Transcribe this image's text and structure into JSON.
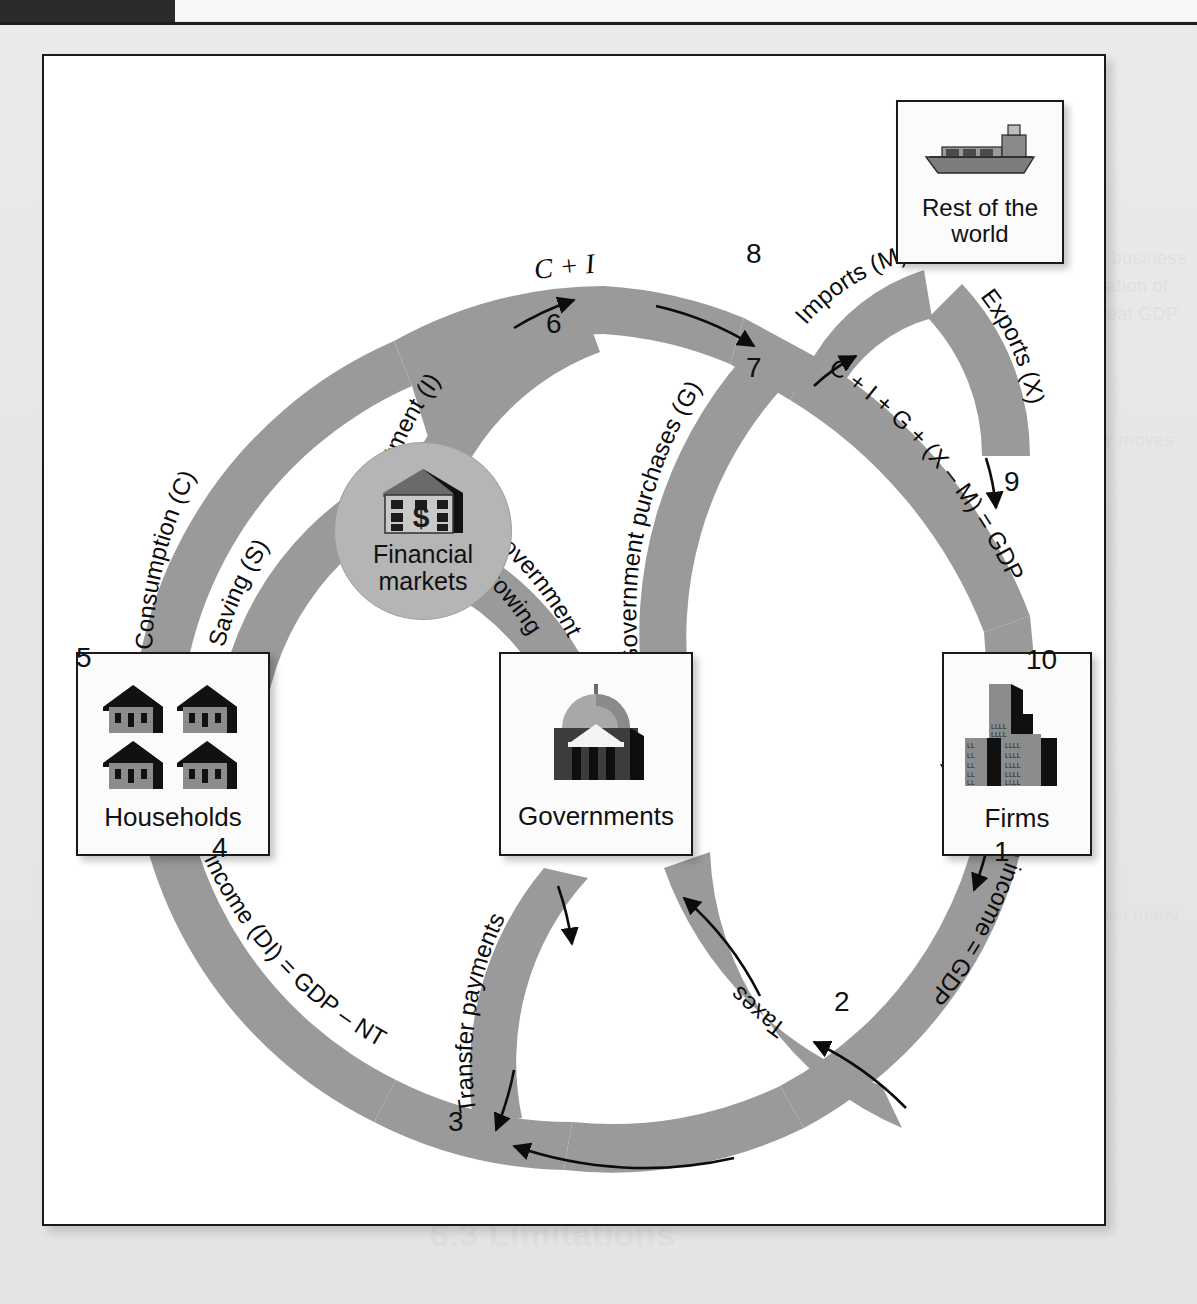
{
  "figure": {
    "band_color": "#9a9a9a",
    "node_fill": "#fbfbfb",
    "financial_node_fill": "#b5b5b5",
    "frame_color": "#1a1a1a"
  },
  "nodes": [
    {
      "id": "households",
      "label": "Households",
      "icon": "houses-icon"
    },
    {
      "id": "governments",
      "label": "Governments",
      "icon": "capitol-building-icon"
    },
    {
      "id": "firms",
      "label": "Firms",
      "icon": "office-buildings-icon"
    },
    {
      "id": "rest_of_world",
      "label_line1": "Rest of the",
      "label_line2": "world",
      "icon": "cargo-ship-icon"
    },
    {
      "id": "financial_markets",
      "label_line1": "Financial",
      "label_line2": "markets",
      "icon": "bank-dollar-icon"
    }
  ],
  "flows": {
    "aggregate_income": "Aggregate income = GDP",
    "taxes": "Taxes",
    "transfer_payments": "Transfer payments",
    "disposable_income": "Disposable income (DI) = GDP – NT",
    "consumption": "Consumption (C)",
    "saving": "Saving (S)",
    "investment": "Investment (I)",
    "government_borrowing_l1": "Government",
    "government_borrowing_l2": "borrowing",
    "government_purchases": "Government purchases (G)",
    "c_plus_i": "C + I",
    "imports": "Imports (M)",
    "exports": "Exports (X)",
    "gdp_identity": "C + I + G + (X – M) = GDP"
  },
  "step_numbers": [
    "1",
    "2",
    "3",
    "4",
    "5",
    "6",
    "7",
    "8",
    "9",
    "10"
  ],
  "ghost_text": {
    "heading": "Business Cycle Dynamics",
    "line_a": "economic activity that alternately expands and contracts the business",
    "line_b": "in aggregate production, income, employment, and the utilization of",
    "line_c": "resources. These fluctuations are measured by changes in real GDP.",
    "line_d": "an expansion, economic activity increases, and the economy moves",
    "line_e": "toward full employment of its resources and rising incomes.",
    "line_f": "contraction, production falls and unemployment rises across many",
    "line_g": "sectors of the economy at the same time.",
    "footer": "6.3 Limitations"
  }
}
